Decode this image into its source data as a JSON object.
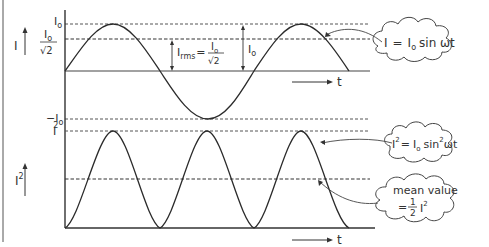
{
  "top_graph": {
    "y_axis_label": "I",
    "y_axis_arrow": "arrow-up",
    "levels": {
      "peak_label": "I",
      "peak_sub": "o",
      "rms_label_num": "I",
      "rms_label_num_sub": "o",
      "rms_label_den": "√2",
      "neg_peak_label": "−I",
      "neg_peak_sub": "o"
    },
    "annotation_rms": {
      "prefix": "I",
      "sub": "rms",
      "equals": "=",
      "num": "I",
      "num_sub": "o",
      "den": "√2"
    },
    "annotation_peak": {
      "label": "I",
      "sub": "o"
    },
    "time_label": "t",
    "equation_cloud": {
      "lhs": "I",
      "eq": "=",
      "rhs_I": "I",
      "rhs_sub": "o",
      "rhs_fn": "sin ωt"
    }
  },
  "bottom_graph": {
    "y_axis_label": "I",
    "y_axis_sup": "2",
    "peak_label": "I",
    "peak_sub": "o",
    "peak_sup": "2",
    "time_label": "t",
    "equation_cloud": {
      "lhs": "I",
      "lhs_sup": "2",
      "eq": "=",
      "rhs_I": "I",
      "rhs_sub": "o",
      "rhs_sup": "2",
      "rhs_fn": "sin",
      "rhs_fn_sup": "2",
      "rhs_arg": "ωt"
    },
    "mean_cloud": {
      "line1": "mean value",
      "eq": "=",
      "frac_num": "1",
      "frac_den": "2",
      "I": "I",
      "sub": "o",
      "sup": "2"
    }
  },
  "colors": {
    "line": "#2b2b2b",
    "text": "#333333",
    "background": "#ffffff"
  }
}
